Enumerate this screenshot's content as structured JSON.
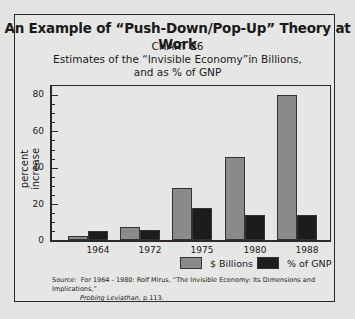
{
  "title": "An Example of “Push-Down/Pop-Up” Theory at Work",
  "chart_number": "CHART 26",
  "subtitle_line1": "Estimates of the “Invisible Economy”in Billions,",
  "subtitle_line2": "and as % of GNP",
  "source_label": "Source:",
  "source_line1": "For 1964 - 1980: Rolf Mirus, “The Invisible Economy: Its Dimensions and Implications,”",
  "source_line2_italic": "Probing Leviathan,",
  "source_line2_rest": " p.113.",
  "chart_data": {
    "type": "bar",
    "xlabel": "",
    "ylabel": "percent increase",
    "ylim": [
      0,
      80
    ],
    "yticks": [
      0,
      20,
      40,
      60,
      80
    ],
    "grid": false,
    "legend_position": "bottom-right",
    "categories": [
      "1964",
      "1972",
      "1975",
      "1980",
      "1988"
    ],
    "series": [
      {
        "name": "$ Billions",
        "color": "#8a8a8a",
        "values": [
          2.5,
          7.5,
          29,
          46,
          80
        ]
      },
      {
        "name": "% of GNP",
        "color": "#1c1c1c",
        "values": [
          5,
          6,
          18,
          14,
          14
        ]
      }
    ]
  },
  "labels": {
    "y0": "0",
    "y20": "20",
    "y40": "40",
    "y60": "60",
    "y80": "80",
    "x0": "1964",
    "x1": "1972",
    "x2": "1975",
    "x3": "1980",
    "x4": "1988",
    "legend0": "$ Billions",
    "legend1": "% of GNP",
    "ytitle": "percent increase"
  }
}
